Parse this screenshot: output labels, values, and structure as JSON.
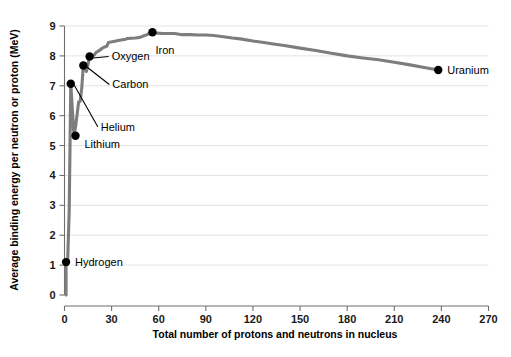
{
  "chart_data": {
    "type": "line",
    "title": "",
    "xlabel": "Total number of protons and neutrons in nucleus",
    "ylabel": "Average binding energy per neutron or proton (MeV)",
    "xlim": [
      0,
      270
    ],
    "ylim": [
      0,
      9
    ],
    "xticks": [
      0,
      30,
      60,
      90,
      120,
      150,
      180,
      210,
      240,
      270
    ],
    "yticks": [
      0,
      1,
      2,
      3,
      4,
      5,
      6,
      7,
      8,
      9
    ],
    "grid": "horizontal",
    "legend": "none",
    "series": [
      {
        "name": "Binding energy curve",
        "color": "#7d7d7d",
        "x": [
          1,
          2,
          3,
          4,
          6,
          7,
          9,
          10,
          11,
          12,
          14,
          16,
          19,
          20,
          23,
          24,
          27,
          28,
          32,
          35,
          39,
          40,
          45,
          48,
          51,
          56,
          59,
          63,
          70,
          75,
          80,
          85,
          90,
          95,
          100,
          107,
          112,
          120,
          127,
          133,
          140,
          150,
          160,
          170,
          180,
          190,
          200,
          210,
          220,
          230,
          238
        ],
        "y": [
          1.1,
          1.12,
          2.83,
          7.07,
          5.33,
          5.61,
          6.46,
          6.48,
          6.93,
          7.68,
          7.48,
          7.98,
          8.03,
          8.11,
          8.21,
          8.26,
          8.33,
          8.45,
          8.49,
          8.52,
          8.56,
          8.58,
          8.6,
          8.62,
          8.68,
          8.79,
          8.76,
          8.75,
          8.75,
          8.71,
          8.71,
          8.7,
          8.7,
          8.68,
          8.65,
          8.6,
          8.57,
          8.5,
          8.45,
          8.4,
          8.35,
          8.26,
          8.18,
          8.09,
          8.0,
          7.93,
          7.87,
          7.79,
          7.7,
          7.6,
          7.53
        ]
      }
    ],
    "annotated_points": [
      {
        "name": "Hydrogen",
        "label": "Hydrogen",
        "x": 1,
        "y": 1.1,
        "label_dx": 9,
        "label_dy": 4,
        "leader": false
      },
      {
        "name": "Lithium",
        "label": "Lithium",
        "x": 7,
        "y": 5.33,
        "label_dx": 9,
        "label_dy": 12,
        "leader": false
      },
      {
        "name": "Helium",
        "label": "Helium",
        "x": 4,
        "y": 7.07,
        "label_dx": 30,
        "label_dy": 47,
        "leader": true
      },
      {
        "name": "Carbon",
        "label": "Carbon",
        "x": 12,
        "y": 7.68,
        "label_dx": 29,
        "label_dy": 23,
        "leader": true
      },
      {
        "name": "Oxygen",
        "label": "Oxygen",
        "x": 16,
        "y": 7.98,
        "label_dx": 22,
        "label_dy": 4,
        "leader": true
      },
      {
        "name": "Iron",
        "label": "Iron",
        "x": 56,
        "y": 8.79,
        "label_dx": 3,
        "label_dy": 22,
        "leader": false
      },
      {
        "name": "Uranium",
        "label": "Uranium",
        "x": 238,
        "y": 7.53,
        "label_dx": 9,
        "label_dy": 4,
        "leader": false
      }
    ],
    "colors": {
      "curve": "#7d7d7d",
      "point": "#000000",
      "grid": "#e3e3e3",
      "axis": "#6e6e6e",
      "background": "#ffffff",
      "text": "#000000"
    }
  }
}
